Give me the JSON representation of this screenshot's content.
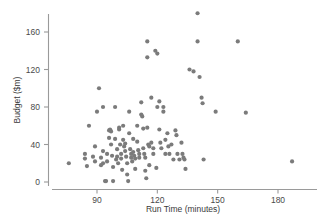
{
  "chart_data": {
    "type": "scatter",
    "title": "",
    "xlabel": "Run Time (minutes)",
    "ylabel": "Budget ($m)",
    "xlim": [
      72,
      192
    ],
    "ylim": [
      -8,
      190
    ],
    "xticks": [
      90,
      120,
      150,
      180
    ],
    "xtick_labels": [
      "90",
      "120",
      "150",
      "180"
    ],
    "yticks": [
      0,
      40,
      80,
      120,
      160
    ],
    "ytick_labels": [
      "0",
      "40",
      "80",
      "120",
      "160"
    ],
    "grid": false,
    "legend": false,
    "marker_color": "#7b7b7b",
    "axis_color": "#9a9a9a",
    "series": [
      {
        "name": "films",
        "points": [
          [
            76,
            20
          ],
          [
            84,
            30
          ],
          [
            84,
            25
          ],
          [
            85,
            17
          ],
          [
            86,
            60
          ],
          [
            88,
            27
          ],
          [
            89,
            22
          ],
          [
            89,
            38
          ],
          [
            90,
            75
          ],
          [
            91,
            100
          ],
          [
            92,
            26
          ],
          [
            92,
            18
          ],
          [
            93,
            80
          ],
          [
            93,
            33
          ],
          [
            93,
            20
          ],
          [
            94,
            1
          ],
          [
            94.5,
            1
          ],
          [
            95,
            22
          ],
          [
            95,
            30
          ],
          [
            96,
            47
          ],
          [
            96,
            55
          ],
          [
            96.5,
            56
          ],
          [
            97,
            54
          ],
          [
            97,
            40
          ],
          [
            97.5,
            28
          ],
          [
            98,
            16
          ],
          [
            98,
            1
          ],
          [
            99,
            80
          ],
          [
            99,
            46
          ],
          [
            99.5,
            24
          ],
          [
            100,
            35
          ],
          [
            100,
            27
          ],
          [
            100.5,
            20
          ],
          [
            101,
            58
          ],
          [
            101,
            56
          ],
          [
            101.5,
            40
          ],
          [
            102,
            30
          ],
          [
            102,
            25
          ],
          [
            102.5,
            13
          ],
          [
            103,
            60
          ],
          [
            103,
            45
          ],
          [
            103.5,
            38
          ],
          [
            104,
            41
          ],
          [
            104,
            33
          ],
          [
            104.5,
            27
          ],
          [
            105,
            20
          ],
          [
            105,
            8
          ],
          [
            105.5,
            1
          ],
          [
            106,
            75
          ],
          [
            106,
            52
          ],
          [
            106.5,
            35
          ],
          [
            107,
            30
          ],
          [
            107,
            26
          ],
          [
            107.5,
            22
          ],
          [
            108,
            46
          ],
          [
            108,
            32
          ],
          [
            108.5,
            28
          ],
          [
            109,
            25
          ],
          [
            109,
            14
          ],
          [
            110,
            60
          ],
          [
            110,
            43
          ],
          [
            110.5,
            34
          ],
          [
            111,
            30
          ],
          [
            111,
            26
          ],
          [
            112,
            85
          ],
          [
            112,
            72
          ],
          [
            112.5,
            70
          ],
          [
            113,
            57
          ],
          [
            113,
            36
          ],
          [
            113.5,
            30
          ],
          [
            114,
            26
          ],
          [
            114,
            12
          ],
          [
            114.5,
            4
          ],
          [
            115,
            150
          ],
          [
            115,
            133
          ],
          [
            115,
            58
          ],
          [
            115.5,
            40
          ],
          [
            116,
            38
          ],
          [
            116,
            18
          ],
          [
            117,
            90
          ],
          [
            117,
            42
          ],
          [
            118,
            36
          ],
          [
            118,
            30
          ],
          [
            119,
            140
          ],
          [
            119.5,
            15
          ],
          [
            120,
            137
          ],
          [
            120,
            80
          ],
          [
            121,
            86
          ],
          [
            121,
            56
          ],
          [
            121.5,
            42
          ],
          [
            122,
            36
          ],
          [
            123,
            80
          ],
          [
            123,
            75
          ],
          [
            124,
            45
          ],
          [
            124,
            30
          ],
          [
            125,
            52
          ],
          [
            125.5,
            38
          ],
          [
            126,
            30
          ],
          [
            127,
            40
          ],
          [
            128,
            24
          ],
          [
            129,
            55
          ],
          [
            129.5,
            50
          ],
          [
            130,
            30
          ],
          [
            131,
            24
          ],
          [
            132,
            42
          ],
          [
            132.5,
            30
          ],
          [
            133,
            26
          ],
          [
            133.5,
            24
          ],
          [
            134,
            14
          ],
          [
            136,
            120
          ],
          [
            138,
            118
          ],
          [
            140,
            180
          ],
          [
            140,
            150
          ],
          [
            141,
            112
          ],
          [
            142,
            90
          ],
          [
            142.5,
            84
          ],
          [
            143,
            24
          ],
          [
            149,
            75
          ],
          [
            160,
            150
          ],
          [
            164,
            74
          ],
          [
            187,
            22
          ]
        ]
      }
    ]
  }
}
